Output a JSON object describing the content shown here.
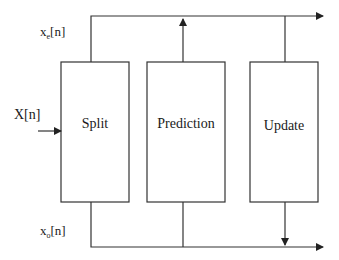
{
  "diagram": {
    "blocks": [
      {
        "id": "split",
        "label": "Split"
      },
      {
        "id": "prediction",
        "label": "Prediction"
      },
      {
        "id": "update",
        "label": "Update"
      }
    ],
    "signals": {
      "input": {
        "base": "X[n]"
      },
      "even": {
        "base": "x",
        "sub": "e",
        "suffix": "[n]"
      },
      "odd": {
        "base": "x",
        "sub": "o",
        "suffix": "[n]"
      }
    },
    "colors": {
      "stroke": "#333333",
      "text": "#1a1a1a"
    }
  }
}
